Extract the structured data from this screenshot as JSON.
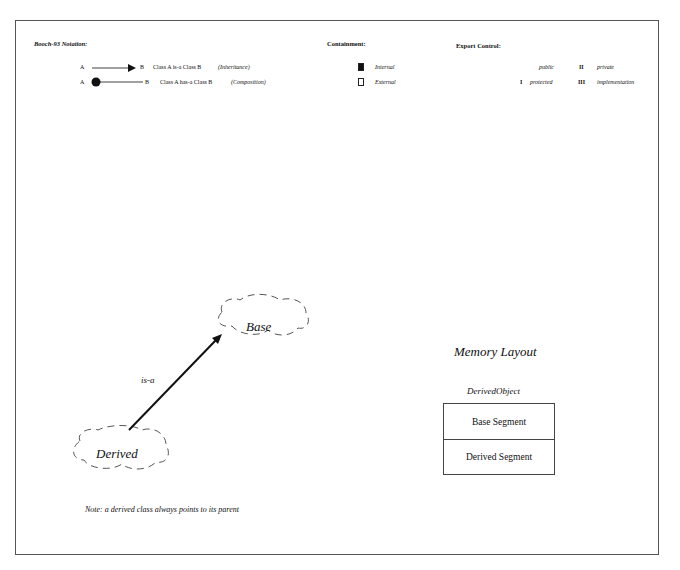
{
  "legend": {
    "notation": {
      "title": "Booch-93 Notation:",
      "rows": [
        {
          "from": "A",
          "to": "B",
          "text": "Class A  is-a  Class B",
          "kind": "(Inheritance)",
          "icon": "arrow-triangle-icon"
        },
        {
          "from": "A",
          "to": "B",
          "text": "Class A  has-a  Class B",
          "kind": "(Composition)",
          "icon": "filled-circle-line-icon"
        }
      ]
    },
    "containment": {
      "title": "Containment:",
      "items": [
        {
          "label": "Internal",
          "icon": "filled-square-icon"
        },
        {
          "label": "External",
          "icon": "empty-square-icon"
        }
      ]
    },
    "export_control": {
      "title": "Export Control:",
      "items": [
        {
          "mark": "",
          "label": "public"
        },
        {
          "mark": "I",
          "label": "protected"
        },
        {
          "mark": "II",
          "label": "private"
        },
        {
          "mark": "III",
          "label": "implementation"
        }
      ]
    }
  },
  "diagram": {
    "base_class": "Base",
    "derived_class": "Derived",
    "relation_label": "is-a",
    "note": "Note: a derived class always points to its parent"
  },
  "memory_layout": {
    "title": "Memory Layout",
    "object_name": "DerivedObject",
    "segments": [
      "Base Segment",
      "Derived Segment"
    ]
  },
  "colors": {
    "line": "#111111",
    "cloud_dash": "#555555",
    "frame": "#555555"
  }
}
